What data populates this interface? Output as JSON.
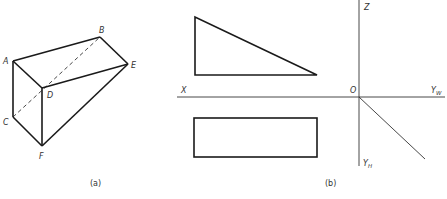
{
  "figure_a": {
    "caption": "(a)",
    "vertices": {
      "A": {
        "label": "A",
        "x": 13,
        "y": 61
      },
      "B": {
        "label": "B",
        "x": 100,
        "y": 37
      },
      "C": {
        "label": "C",
        "x": 13,
        "y": 117
      },
      "D": {
        "label": "D",
        "x": 42,
        "y": 88
      },
      "E": {
        "label": "E",
        "x": 128,
        "y": 64
      },
      "F": {
        "label": "F",
        "x": 42,
        "y": 146
      }
    },
    "hidden_edges": [
      "C-B"
    ]
  },
  "figure_b": {
    "caption": "(b)",
    "axes": {
      "x_label": "X",
      "z_label": "Z",
      "origin_label": "O",
      "yw_label": "Y",
      "yw_sub": "W",
      "yh_label": "Y",
      "yh_sub": "H"
    },
    "front_view": "triangle",
    "top_view": "rectangle"
  }
}
